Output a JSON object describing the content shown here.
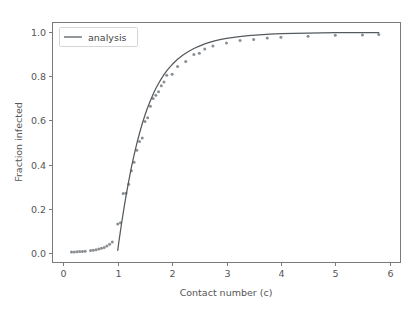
{
  "figure": {
    "background_color": "#ffffff",
    "axes_color": "#7a7a7a",
    "line_color": "#555a5e",
    "marker_color": "#8a8f93",
    "text_color": "#555555"
  },
  "chart_data": {
    "type": "line",
    "title": "",
    "xlabel": "Contact number (c)",
    "ylabel": "Fraction infected",
    "xlim": [
      -0.2,
      6.2
    ],
    "ylim": [
      -0.045,
      1.045
    ],
    "xticks": [
      0,
      1,
      2,
      3,
      4,
      5,
      6
    ],
    "xtick_labels": [
      "0",
      "1",
      "2",
      "3",
      "4",
      "5",
      "6"
    ],
    "yticks": [
      0.0,
      0.2,
      0.4,
      0.6,
      0.8,
      1.0
    ],
    "ytick_labels": [
      "0.0",
      "0.2",
      "0.4",
      "0.6",
      "0.8",
      "1.0"
    ],
    "grid": false,
    "legend": {
      "position": "upper left",
      "entries": [
        {
          "label": "analysis",
          "type": "line",
          "color": "#555a5e"
        }
      ]
    },
    "series": [
      {
        "name": "analysis",
        "type": "line",
        "color": "#555a5e",
        "x": [
          1.0,
          1.02,
          1.04,
          1.06,
          1.08,
          1.1,
          1.12,
          1.15,
          1.18,
          1.2,
          1.25,
          1.3,
          1.35,
          1.4,
          1.45,
          1.5,
          1.55,
          1.6,
          1.65,
          1.7,
          1.75,
          1.8,
          1.85,
          1.9,
          1.95,
          2.0,
          2.1,
          2.2,
          2.3,
          2.4,
          2.5,
          2.6,
          2.7,
          2.8,
          2.9,
          3.0,
          3.2,
          3.4,
          3.6,
          3.8,
          4.0,
          4.25,
          4.5,
          4.75,
          5.0,
          5.25,
          5.5,
          5.6,
          5.7,
          5.8
        ],
        "y": [
          0.01,
          0.048,
          0.082,
          0.115,
          0.148,
          0.179,
          0.21,
          0.254,
          0.295,
          0.322,
          0.386,
          0.443,
          0.495,
          0.542,
          0.585,
          0.624,
          0.659,
          0.69,
          0.719,
          0.745,
          0.768,
          0.789,
          0.808,
          0.825,
          0.84,
          0.854,
          0.878,
          0.897,
          0.913,
          0.927,
          0.938,
          0.948,
          0.956,
          0.963,
          0.968,
          0.973,
          0.98,
          0.985,
          0.989,
          0.992,
          0.994,
          0.996,
          0.997,
          0.998,
          0.9985,
          0.999,
          0.9992,
          0.9993,
          0.9994,
          0.9995
        ]
      },
      {
        "name": "simulation",
        "type": "scatter",
        "color": "#8a8f93",
        "x": [
          0.15,
          0.2,
          0.25,
          0.3,
          0.35,
          0.4,
          0.5,
          0.55,
          0.6,
          0.65,
          0.7,
          0.75,
          0.8,
          0.85,
          0.9,
          1.0,
          1.05,
          1.1,
          1.15,
          1.2,
          1.25,
          1.3,
          1.35,
          1.4,
          1.45,
          1.5,
          1.55,
          1.6,
          1.65,
          1.7,
          1.75,
          1.8,
          1.85,
          1.9,
          2.0,
          2.1,
          2.25,
          2.4,
          2.5,
          2.6,
          2.75,
          3.0,
          3.25,
          3.5,
          3.75,
          4.0,
          4.5,
          5.0,
          5.5,
          5.8
        ],
        "y": [
          0.003,
          0.003,
          0.004,
          0.005,
          0.005,
          0.006,
          0.01,
          0.011,
          0.013,
          0.016,
          0.02,
          0.023,
          0.03,
          0.038,
          0.048,
          0.13,
          0.135,
          0.268,
          0.27,
          0.31,
          0.372,
          0.41,
          0.465,
          0.505,
          0.52,
          0.595,
          0.612,
          0.665,
          0.7,
          0.715,
          0.73,
          0.758,
          0.775,
          0.805,
          0.81,
          0.845,
          0.868,
          0.9,
          0.905,
          0.925,
          0.938,
          0.952,
          0.963,
          0.968,
          0.975,
          0.978,
          0.983,
          0.987,
          0.988,
          0.99
        ]
      }
    ]
  }
}
